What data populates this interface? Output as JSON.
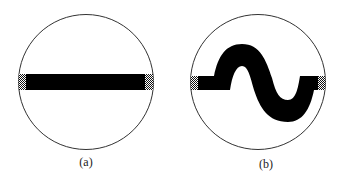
{
  "figure": {
    "panels": [
      {
        "id": "a",
        "label": "(a)",
        "shape": "circle",
        "content": "straight horizontal bar with stippled end caps"
      },
      {
        "id": "b",
        "label": "(b)",
        "shape": "circle",
        "content": "S-shaped (sinusoidal) band with stippled end caps"
      }
    ],
    "colors": {
      "outline": "#333333",
      "fill": "#000000",
      "stipple": "#555555",
      "background": "#ffffff"
    }
  }
}
